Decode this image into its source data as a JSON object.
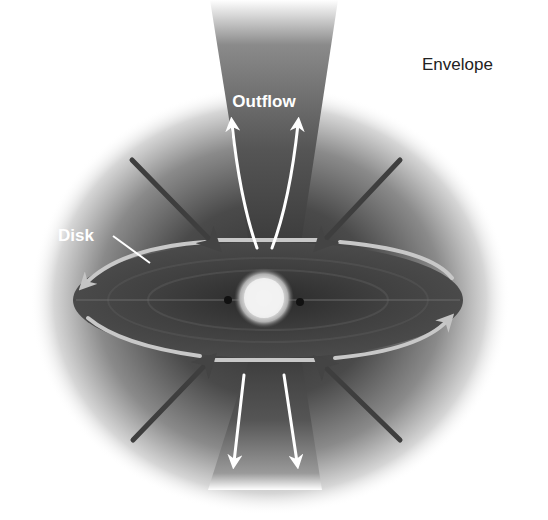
{
  "diagram": {
    "labels": {
      "outflow": "Outflow",
      "disk": "Disk",
      "envelope": "Envelope"
    },
    "components": [
      {
        "id": "envelope",
        "description": "diffuse grey cloud surrounding system"
      },
      {
        "id": "outflow-cones",
        "description": "bipolar outflow cones above and below disk"
      },
      {
        "id": "disk",
        "description": "flattened rotating disk, shown edge-on tilted"
      },
      {
        "id": "protostar",
        "description": "bright central glowing source"
      },
      {
        "id": "infall-arrows",
        "description": "four dark arrows from envelope toward disk"
      },
      {
        "id": "outflow-arrows",
        "description": "four white arrows pointing away along outflow axis"
      },
      {
        "id": "rotation-arrows",
        "description": "light arrows curving around disk rim showing rotation"
      }
    ],
    "colors": {
      "background": "#ffffff",
      "envelope_core": "#3a3a3a",
      "outflow_cone": "#5a5a5a",
      "disk": "#3c3c3c",
      "protostar": "#f4f4f4",
      "infall_arrow": "#3a3a3a",
      "outflow_arrow": "#ffffff",
      "rotation_arrow": "#c8c8c8"
    }
  }
}
